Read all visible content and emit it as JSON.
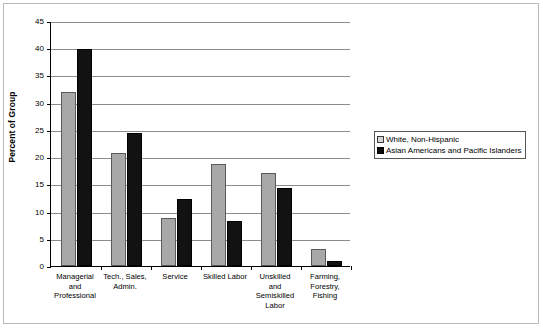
{
  "chart_data": {
    "type": "bar",
    "title": "",
    "xlabel": "",
    "ylabel": "Percent of Group",
    "ylim": [
      0,
      45
    ],
    "yticks": [
      0,
      5,
      10,
      15,
      20,
      25,
      30,
      35,
      40,
      45
    ],
    "grid": true,
    "legend_position": "right",
    "categories": [
      "Managerial and Professional",
      "Tech., Sales, Admin.",
      "Service",
      "Skilled Labor",
      "Unskilled and Semiskilled Labor",
      "Farming, Forestry, Fishing"
    ],
    "category_lines": [
      [
        "Managerial",
        "and",
        "Professional"
      ],
      [
        "Tech., Sales,",
        "Admin."
      ],
      [
        "Service"
      ],
      [
        "Skilled Labor"
      ],
      [
        "Unskilled",
        "and",
        "Semiskilled",
        "Labor"
      ],
      [
        "Farming,",
        "Forestry,",
        "Fishing"
      ]
    ],
    "series": [
      {
        "name": "White, Non-Hispanic",
        "color": "#a8a8a8",
        "values": [
          32.0,
          20.7,
          8.8,
          18.8,
          17.1,
          3.2
        ]
      },
      {
        "name": "Asian Americans and Pacific Islanders",
        "color": "#121212",
        "values": [
          39.9,
          24.5,
          12.4,
          8.2,
          14.4,
          1.0
        ]
      }
    ]
  },
  "axis": {
    "y_title": "Percent of Group",
    "y_tick_labels": [
      "45",
      "40",
      "35",
      "30",
      "25",
      "20",
      "15",
      "10",
      "5",
      "0"
    ]
  },
  "legend": {
    "entries": [
      {
        "label": "White, Non-Hispanic",
        "swatch": "light-gray-square"
      },
      {
        "label": "Asian Americans and Pacific Islanders",
        "swatch": "black-square"
      }
    ]
  }
}
